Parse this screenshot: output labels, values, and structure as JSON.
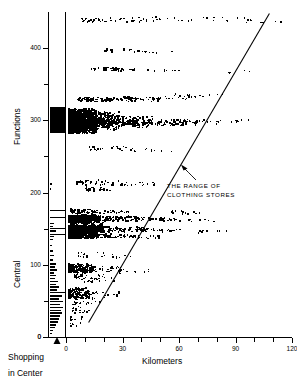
{
  "chart_data": {
    "type": "scatter",
    "title": "",
    "xlabel": "Kilometers",
    "ylabel": "Central Functions",
    "xlim": [
      0,
      120
    ],
    "ylim": [
      0,
      450
    ],
    "grid": false,
    "legend": null,
    "xticks": [
      0,
      10,
      20,
      30,
      40,
      50,
      60,
      70,
      80,
      90,
      100,
      110,
      120
    ],
    "xticklabels": [
      "0",
      "",
      "",
      "30",
      "",
      "",
      "60",
      "",
      "",
      "90",
      "",
      "",
      "120"
    ],
    "yticks": [
      0,
      50,
      100,
      150,
      200,
      250,
      300,
      350,
      400
    ],
    "yticklabels": [
      "0",
      "",
      "100",
      "",
      "200",
      "",
      "300",
      "",
      "400"
    ],
    "annotations": [
      {
        "text_line1": "THE RANGE OF",
        "text_line2": "CLOTHING STORES",
        "x": 55,
        "y": 175
      }
    ],
    "reference_line": {
      "label": "range boundary",
      "x_start": 12,
      "y_start": 20,
      "x_end": 108,
      "y_end": 448
    },
    "left_panel": {
      "label_line1": "Shopping",
      "label_line2": "in Center",
      "description": "marginal distribution strip of central functions for shopping-in-center places"
    },
    "series": [
      {
        "name": "Central places",
        "marker": "dot",
        "color": "#000000",
        "points_dense_bands": [
          {
            "y": 300,
            "x_from": 2,
            "x_to": 42,
            "density": "very-high"
          },
          {
            "y": 296,
            "x_from": 2,
            "x_to": 60,
            "density": "high"
          },
          {
            "y": 308,
            "x_from": 4,
            "x_to": 26,
            "density": "high"
          },
          {
            "y": 330,
            "x_from": 10,
            "x_to": 52,
            "density": "medium"
          },
          {
            "y": 165,
            "x_from": 3,
            "x_to": 40,
            "density": "high"
          },
          {
            "y": 150,
            "x_from": 3,
            "x_to": 44,
            "density": "high"
          },
          {
            "y": 143,
            "x_from": 3,
            "x_to": 30,
            "density": "medium"
          },
          {
            "y": 95,
            "x_from": 2,
            "x_to": 24,
            "density": "medium"
          },
          {
            "y": 60,
            "x_from": 2,
            "x_to": 18,
            "density": "medium"
          }
        ]
      }
    ]
  },
  "axes": {
    "x_axis_name": "Kilometers",
    "y_axis_name_line1": "Central",
    "y_axis_name_line2": "Functions"
  }
}
